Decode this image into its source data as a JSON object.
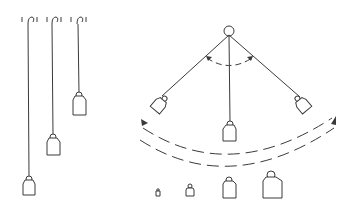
{
  "diagram": {
    "left_panel": {
      "description": "Three pendulums of different string lengths hanging from hooks",
      "pendulums": [
        {
          "label": "long",
          "hook_x": 30,
          "bob_y": 185
        },
        {
          "label": "medium",
          "hook_x": 54,
          "bob_y": 145
        },
        {
          "label": "short",
          "hook_x": 79,
          "bob_y": 105
        }
      ]
    },
    "right_panel": {
      "description": "Single pendulum swinging between two extreme positions with dashed arc showing swing direction",
      "positions": [
        "left",
        "center",
        "right"
      ],
      "annotations": [
        "angle-arc",
        "swing-arc-arrows"
      ]
    },
    "bottom_row": {
      "description": "Four bobs of increasing size",
      "bobs": [
        "tiny",
        "small",
        "medium",
        "large"
      ]
    },
    "colors": {
      "stroke": "#3a3a3a",
      "background": "#ffffff"
    }
  }
}
